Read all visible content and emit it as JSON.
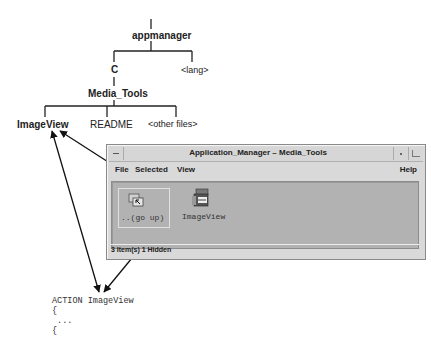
{
  "diagram": {
    "tree": {
      "root": "appmanager",
      "level1": [
        "C",
        "<lang>"
      ],
      "level2": "Media_Tools",
      "level3": [
        "ImageView",
        "README",
        "<other files>"
      ]
    },
    "window": {
      "title": "Application_Manager – Media_Tools",
      "menu": {
        "file": "File",
        "selected": "Selected",
        "view": "View",
        "help": "Help"
      },
      "icons": [
        {
          "label": "..(go up)",
          "icon": "folder-up-icon"
        },
        {
          "label": "ImageView",
          "icon": "action-icon"
        }
      ],
      "status": "3 Item(s) 1 Hidden"
    },
    "code": {
      "line1": "ACTION ImageView",
      "line2": "{",
      "line3": " ...",
      "line4": "{"
    },
    "colors": {
      "window_bg": "#d9d9d9",
      "content_bg": "#b2b2b2",
      "line": "#222222"
    }
  }
}
